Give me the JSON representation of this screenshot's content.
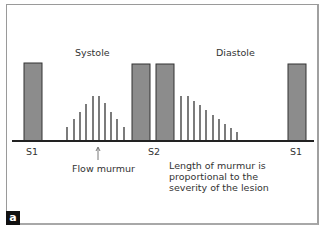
{
  "figure": {
    "panel_label": "a",
    "phases": {
      "systole": "Systole",
      "diastole": "Diastole"
    },
    "sound_labels": {
      "s1_left": "S1",
      "s2": "S2",
      "s1_right": "S1"
    },
    "annotations": {
      "flow_murmur": "Flow murmur",
      "note": "Length of murmur is\nproportional to the\nseverity of the lesion"
    },
    "colors": {
      "bar_fill": "#8c8c8c",
      "bar_stroke": "#333333",
      "line": "#444444",
      "baseline": "#222222"
    }
  },
  "chart_data": {
    "type": "bar",
    "title": "",
    "heart_sounds": [
      {
        "label": "S1",
        "x": 33,
        "height": 78
      },
      {
        "label": "S2",
        "x": 141,
        "height": 77
      },
      {
        "label": "S2",
        "x": 165,
        "height": 77
      },
      {
        "label": "S1",
        "x": 297,
        "height": 77
      }
    ],
    "series": [
      {
        "name": "Systolic flow murmur",
        "x": [
          67,
          74,
          80,
          86,
          93,
          99,
          105,
          111,
          117,
          124
        ],
        "values": [
          14,
          22,
          29,
          37,
          45,
          45,
          38,
          29,
          22,
          14
        ]
      },
      {
        "name": "Diastolic murmur",
        "x": [
          181,
          188,
          194,
          200,
          206,
          213,
          219,
          225,
          231,
          237
        ],
        "values": [
          45,
          45,
          40,
          36,
          31,
          26,
          22,
          17,
          13,
          9
        ]
      }
    ],
    "xlabel": "",
    "ylabel": "",
    "legend": [],
    "grid": false
  }
}
